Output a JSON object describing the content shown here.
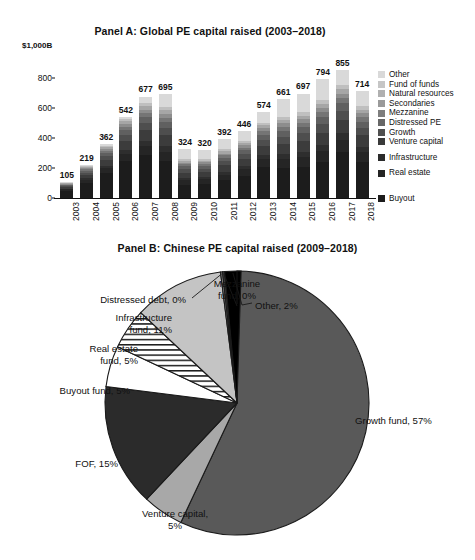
{
  "figure": {
    "background": "#ffffff",
    "text_color": "#111111"
  },
  "panel_a": {
    "title": "Panel A: Global PE capital raised (2003–2018)",
    "axis_unit_label": "$1,000B",
    "legend_title": "",
    "chart_data": {
      "type": "bar",
      "stacked": true,
      "title": "Panel A: Global PE capital raised (2003–2018)",
      "xlabel": "",
      "ylabel": "$1,000B",
      "ylim": [
        0,
        1000
      ],
      "yticks": [
        0,
        200,
        400,
        600,
        800,
        1000
      ],
      "ytick_labels": [
        "0",
        "200",
        "400",
        "600",
        "800",
        "$1,000B"
      ],
      "grid": false,
      "legend_position": "right",
      "categories": [
        "2003",
        "2004",
        "2005",
        "2006",
        "2007",
        "2008",
        "2009",
        "2010",
        "2011",
        "2012",
        "2013",
        "2014",
        "2015",
        "2016",
        "2017",
        "2018"
      ],
      "totals": [
        105,
        219,
        362,
        542,
        677,
        695,
        324,
        320,
        392,
        446,
        574,
        661,
        697,
        794,
        855,
        714
      ],
      "series": [
        {
          "name": "Buyout",
          "color": "#1c1c1c",
          "values": [
            48,
            100,
            165,
            248,
            285,
            245,
            90,
            95,
            120,
            150,
            205,
            200,
            210,
            240,
            310,
            240
          ]
        },
        {
          "name": "Real estate",
          "color": "#252525",
          "values": [
            9,
            20,
            32,
            48,
            62,
            64,
            30,
            29,
            36,
            41,
            53,
            61,
            64,
            73,
            79,
            66
          ]
        },
        {
          "name": "Infrastructure",
          "color": "#2e2e2e",
          "values": [
            5,
            11,
            18,
            27,
            34,
            35,
            16,
            16,
            20,
            22,
            29,
            33,
            35,
            40,
            43,
            36
          ]
        },
        {
          "name": "Venture capital",
          "color": "#3c3c3c",
          "values": [
            11,
            23,
            38,
            57,
            71,
            73,
            34,
            34,
            41,
            47,
            60,
            69,
            73,
            83,
            90,
            75
          ]
        },
        {
          "name": "Growth",
          "color": "#4e4e4e",
          "values": [
            7,
            15,
            25,
            38,
            47,
            49,
            23,
            22,
            27,
            31,
            40,
            46,
            49,
            56,
            60,
            50
          ]
        },
        {
          "name": "Distressed PE",
          "color": "#606060",
          "values": [
            6,
            13,
            22,
            33,
            41,
            42,
            20,
            19,
            24,
            27,
            35,
            40,
            42,
            48,
            51,
            43
          ]
        },
        {
          "name": "Mezzanine",
          "color": "#757575",
          "values": [
            4,
            9,
            14,
            22,
            27,
            28,
            13,
            13,
            16,
            18,
            23,
            26,
            28,
            32,
            34,
            29
          ]
        },
        {
          "name": "Secondaries",
          "color": "#8d8d8d",
          "values": [
            4,
            7,
            12,
            19,
            23,
            24,
            11,
            11,
            13,
            15,
            20,
            23,
            24,
            27,
            29,
            25
          ]
        },
        {
          "name": "Natural resources",
          "color": "#a6a6a6",
          "values": [
            4,
            7,
            12,
            19,
            24,
            24,
            11,
            11,
            14,
            15,
            20,
            23,
            24,
            28,
            30,
            25
          ]
        },
        {
          "name": "Fund of funds",
          "color": "#bfbfbf",
          "values": [
            4,
            7,
            12,
            17,
            21,
            22,
            10,
            10,
            13,
            14,
            18,
            21,
            22,
            25,
            27,
            22
          ]
        },
        {
          "name": "Other",
          "color": "#d9d9d9",
          "values": [
            3,
            7,
            12,
            14,
            42,
            89,
            66,
            60,
            68,
            66,
            71,
            119,
            126,
            142,
            102,
            103
          ]
        }
      ],
      "legend_entries": [
        {
          "label": "Other",
          "color": "#d9d9d9"
        },
        {
          "label": "Fund of funds",
          "color": "#c6c6c6"
        },
        {
          "label": "Natural resources",
          "color": "#b0b0b0"
        },
        {
          "label": "Secondaries",
          "color": "#9a9a9a"
        },
        {
          "label": "Mezzanine",
          "color": "#7e7e7e"
        },
        {
          "label": "Distressed PE",
          "color": "#676767"
        },
        {
          "label": "Growth",
          "color": "#505050"
        },
        {
          "label": "Venture capital",
          "color": "#3a3a3a"
        },
        {
          "label": "Infrastructure",
          "color": "#2b2b2b",
          "gap_before": 6
        },
        {
          "label": "Real estate",
          "color": "#242424",
          "gap_before": 6
        },
        {
          "label": "Buyout",
          "color": "#1c1c1c",
          "gap_before": 16
        }
      ]
    }
  },
  "panel_b": {
    "title": "Panel B: Chinese PE capital raised (2009–2018)",
    "chart_data": {
      "type": "pie",
      "title": "Panel B: Chinese PE capital raised (2009–2018)",
      "start_angle_deg": -90,
      "direction": "clockwise",
      "slices": [
        {
          "label": "Growth fund",
          "value": 57,
          "display": "Growth fund, 57%",
          "color": "#595959",
          "pattern": "solid"
        },
        {
          "label": "Venture capital",
          "value": 5,
          "display": "Venture capital, 5%",
          "color": "#a8a8a8",
          "pattern": "solid"
        },
        {
          "label": "FOF",
          "value": 15,
          "display": "FOF, 15%",
          "color": "#2b2b2b",
          "pattern": "solid"
        },
        {
          "label": "Buyout fund",
          "value": 5,
          "display": "Buyout fund, 5%",
          "color": "#ffffff",
          "pattern": "solid"
        },
        {
          "label": "Real estate fund",
          "value": 5,
          "display": "Real estate fund, 5%",
          "color": "#ffffff",
          "pattern": "horizontal-stripes"
        },
        {
          "label": "Infrastructure fund",
          "value": 11,
          "display": "Infrastructure fund, 11%",
          "color": "#c4c4c4",
          "pattern": "solid"
        },
        {
          "label": "Distressed debt",
          "value": 0,
          "display": "Distressed debt, 0%",
          "color": "#8a8a8a",
          "pattern": "solid"
        },
        {
          "label": "Mezzanine fund",
          "value": 0,
          "display": "Mezzanine fund, 0%",
          "color": "#404040",
          "pattern": "solid"
        },
        {
          "label": "Other",
          "value": 2,
          "display": "Other, 2%",
          "color": "#000000",
          "pattern": "solid"
        }
      ],
      "labels": [
        {
          "text_lines": [
            "Mezzanine",
            "fund, 0%"
          ],
          "display": "Mezzanine fund, 0%"
        },
        {
          "text_lines": [
            "Other, 2%"
          ],
          "display": "Other, 2%"
        },
        {
          "text_lines": [
            "Distressed debt, 0%"
          ],
          "display": "Distressed debt, 0%"
        },
        {
          "text_lines": [
            "Infrastructure",
            "fund, 11%"
          ],
          "display": "Infrastructure fund, 11%"
        },
        {
          "text_lines": [
            "Real estate",
            "fund, 5%"
          ],
          "display": "Real estate fund, 5%"
        },
        {
          "text_lines": [
            "Buyout fund, 5%"
          ],
          "display": "Buyout fund, 5%"
        },
        {
          "text_lines": [
            "FOF, 15%"
          ],
          "display": "FOF, 15%"
        },
        {
          "text_lines": [
            "Venture capital,",
            "5%"
          ],
          "display": "Venture capital, 5%"
        },
        {
          "text_lines": [
            "Growth fund, 57%"
          ],
          "display": "Growth fund, 57%"
        }
      ]
    }
  }
}
